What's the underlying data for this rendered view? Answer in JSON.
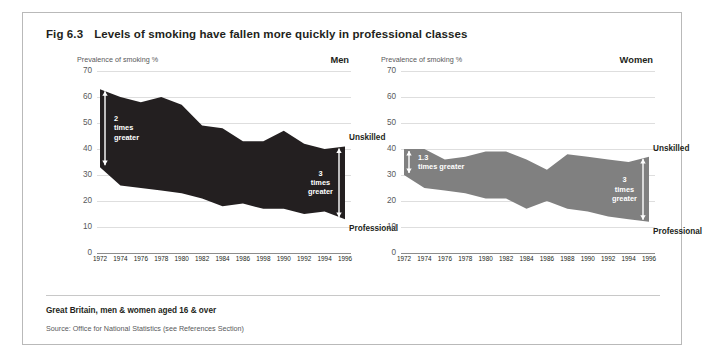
{
  "figure": {
    "number": "Fig 6.3",
    "title": "Levels of smoking have fallen more quickly in professional classes",
    "footnote": "Great Britain, men & women aged 16 & over",
    "source": "Source: Office for National Statistics (see References Section)",
    "border_color": "#b9b9b9"
  },
  "chart_data": [
    {
      "type": "area",
      "panel_id": "men",
      "title": "Men",
      "ylabel": "Prevalence of smoking %",
      "xlabel": "",
      "ylim": [
        0,
        70
      ],
      "yticks": [
        0,
        10,
        20,
        30,
        40,
        50,
        60,
        70
      ],
      "grid": true,
      "legend_position": "inline-right",
      "fill_color": "#231f20",
      "categories": [
        "1972",
        "1974",
        "1976",
        "1978",
        "1980",
        "1982",
        "1984",
        "1986",
        "1998",
        "1990",
        "1992",
        "1994",
        "1996"
      ],
      "series": [
        {
          "name": "Unskilled",
          "values": [
            63,
            60,
            58,
            60,
            57,
            49,
            48,
            43,
            43,
            47,
            42,
            40,
            41
          ]
        },
        {
          "name": "Professional",
          "values": [
            33,
            26,
            25,
            24,
            23,
            21,
            18,
            19,
            17,
            17,
            15,
            16,
            13
          ]
        }
      ],
      "annotations": [
        {
          "id": "left-ratio",
          "lines": [
            "2",
            "times",
            "greater"
          ],
          "at_category": "1972",
          "from_value": 33,
          "to_value": 63
        },
        {
          "id": "right-ratio",
          "lines": [
            "3",
            "times",
            "greater"
          ],
          "at_category": "1996",
          "from_value": 13,
          "to_value": 41
        }
      ]
    },
    {
      "type": "area",
      "panel_id": "women",
      "title": "Women",
      "ylabel": "Prevalence of smoking %",
      "xlabel": "",
      "ylim": [
        0,
        70
      ],
      "yticks": [
        0,
        10,
        20,
        30,
        40,
        50,
        60,
        70
      ],
      "grid": true,
      "legend_position": "inline-right",
      "fill_color": "#808080",
      "categories": [
        "1972",
        "1974",
        "1976",
        "1978",
        "1980",
        "1982",
        "1984",
        "1986",
        "1988",
        "1990",
        "1992",
        "1994",
        "1996"
      ],
      "series": [
        {
          "name": "Unskilled",
          "values": [
            40,
            40,
            36,
            37,
            39,
            39,
            36,
            32,
            38,
            37,
            36,
            35,
            37
          ]
        },
        {
          "name": "Professional",
          "values": [
            30,
            25,
            24,
            23,
            21,
            21,
            17,
            20,
            17,
            16,
            14,
            13,
            12
          ]
        }
      ],
      "annotations": [
        {
          "id": "left-ratio",
          "lines": [
            "1.3",
            "times greater"
          ],
          "at_category": "1972",
          "from_value": 30,
          "to_value": 40
        },
        {
          "id": "right-ratio",
          "lines": [
            "3",
            "times",
            "greater"
          ],
          "at_category": "1996",
          "from_value": 12,
          "to_value": 37
        }
      ]
    }
  ]
}
